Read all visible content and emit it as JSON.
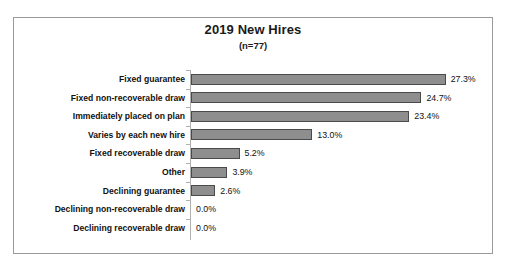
{
  "chart_data": {
    "type": "bar",
    "orientation": "horizontal",
    "title": "2019 New Hires",
    "subtitle": "(n=77)",
    "xlabel": "",
    "ylabel": "",
    "xlim": [
      0,
      30
    ],
    "grid": false,
    "legend": false,
    "bar_color": "#8e8e8e",
    "bar_border_color": "#4a4a4a",
    "axis_color": "#b0b0b0",
    "frame_color": "#9a9a9a",
    "categories": [
      "Fixed guarantee",
      "Fixed non-recoverable draw",
      "Immediately placed on plan",
      "Varies by each new hire",
      "Fixed recoverable draw",
      "Other",
      "Declining guarantee",
      "Declining non-recoverable draw",
      "Declining recoverable draw"
    ],
    "values": [
      27.3,
      24.7,
      23.4,
      13.0,
      5.2,
      3.9,
      2.6,
      0.0,
      0.0
    ],
    "value_labels": [
      "27.3%",
      "24.7%",
      "23.4%",
      "13.0%",
      "5.2%",
      "3.9%",
      "2.6%",
      "0.0%",
      "0.0%"
    ]
  }
}
